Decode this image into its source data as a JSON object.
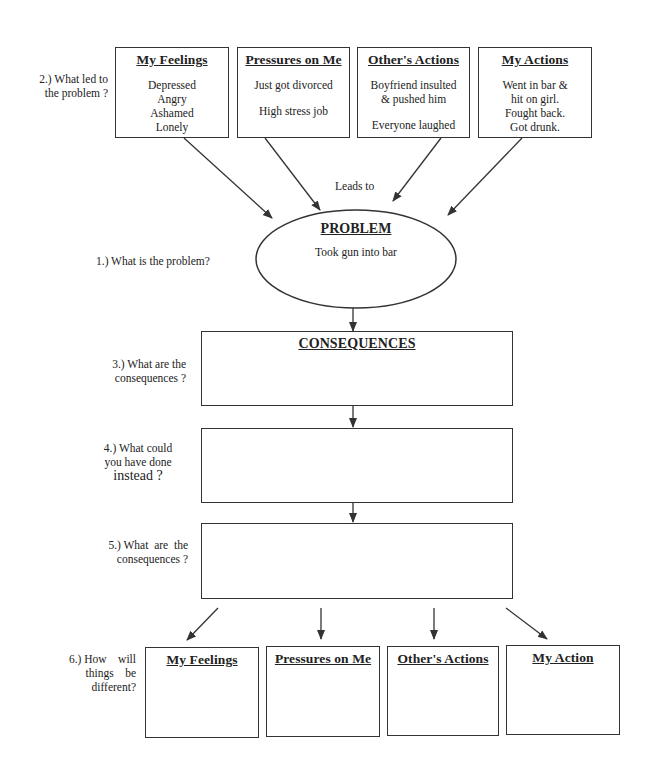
{
  "steps": {
    "step1": "1.) What is the problem?",
    "step2_line1": "2.) What led to",
    "step2_line2": "the problem ?",
    "step3_line1": "3.) What are the",
    "step3_line2": "consequences ?",
    "step4_line1": "4.) What could",
    "step4_line2": "you have done",
    "step4_line3": "instead ?",
    "step5_line1": "5.) What  are  the",
    "step5_line2": "consequences ?",
    "step6_line1": "6.) How    will",
    "step6_line2": "things    be",
    "step6_line3": "different?"
  },
  "top_boxes": [
    {
      "title": "My Feelings",
      "lines": [
        "Depressed",
        "Angry",
        "Ashamed",
        "Lonely"
      ]
    },
    {
      "title": "Pressures on Me",
      "lines": [
        "Just got divorced",
        "",
        "High stress job"
      ]
    },
    {
      "title": "Other's Actions",
      "lines": [
        "Boyfriend insulted",
        "& pushed him",
        "",
        "Everyone laughed"
      ]
    },
    {
      "title": "My Actions",
      "lines": [
        "Went in bar &",
        "hit on girl.",
        "Fought back.",
        "Got drunk."
      ]
    }
  ],
  "connector_label": "Leads to",
  "problem": {
    "title": "PROBLEM",
    "text": "Took gun into bar"
  },
  "consequences": {
    "title": "CONSEQUENCES",
    "text": ""
  },
  "alternative": {
    "text": ""
  },
  "alternative_consequences": {
    "text": ""
  },
  "bottom_boxes": [
    {
      "title": "My Feelings",
      "text": ""
    },
    {
      "title": "Pressures on Me",
      "text": ""
    },
    {
      "title": "Other's Actions",
      "text": ""
    },
    {
      "title": "My Action",
      "text": ""
    }
  ],
  "colors": {
    "line": "#333333",
    "text": "#222222",
    "background": "#ffffff"
  }
}
